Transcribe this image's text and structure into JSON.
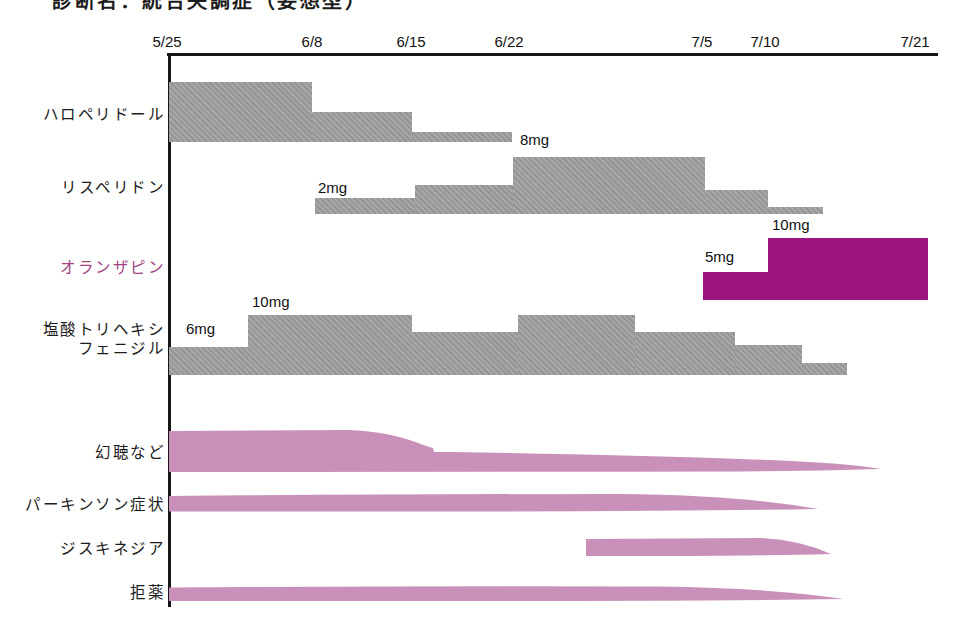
{
  "header": {
    "diagnosis_title": "診断名：統合失調症（妄想型）"
  },
  "chart_data": {
    "type": "bar",
    "subtype": "medication-timeline-gantt",
    "title": "診断名：統合失調症（妄想型）",
    "palette": {
      "bar_gray": "#9d9d9d",
      "accent_magenta": "#9c1480",
      "symptom_pink": "#c991b9",
      "title_pink": "#b2559c",
      "axis_black": "#161616"
    },
    "x_axis": {
      "unit": "date",
      "line": {
        "x1": 167,
        "x2": 938,
        "y": 53
      },
      "origin_x": 169,
      "axis_bottom_y": 607,
      "ticks": [
        {
          "label": "5/25",
          "x": 167
        },
        {
          "label": "6/8",
          "x": 312
        },
        {
          "label": "6/15",
          "x": 411
        },
        {
          "label": "6/22",
          "x": 509
        },
        {
          "label": "7/5",
          "x": 702
        },
        {
          "label": "7/10",
          "x": 765
        },
        {
          "label": "7/21",
          "x": 915
        }
      ]
    },
    "medications": [
      {
        "name": "ハロペリドール",
        "label_y": 105,
        "label_color": "#1c1c1c",
        "color": "#9d9d9d",
        "hatch": true,
        "bottom": 142,
        "segments": [
          {
            "x1": 169,
            "x2": 312,
            "top": 82,
            "from": "5/25",
            "to": "6/8"
          },
          {
            "x1": 312,
            "x2": 412,
            "top": 112,
            "from": "6/8",
            "to": "6/15"
          },
          {
            "x1": 412,
            "x2": 512,
            "top": 132,
            "from": "6/15",
            "to": "6/22"
          }
        ]
      },
      {
        "name": "リスペリドン",
        "label_y": 178,
        "label_color": "#1c1c1c",
        "color": "#9d9d9d",
        "hatch": true,
        "bottom": 214,
        "segments": [
          {
            "x1": 315,
            "x2": 415,
            "top": 198,
            "dose": "2mg",
            "from": "6/8",
            "to": "6/15"
          },
          {
            "x1": 415,
            "x2": 513,
            "top": 185,
            "from": "6/15",
            "to": "6/22"
          },
          {
            "x1": 513,
            "x2": 705,
            "top": 157,
            "dose": "8mg",
            "from": "6/22",
            "to": "7/5"
          },
          {
            "x1": 705,
            "x2": 768,
            "top": 190,
            "from": "7/5",
            "to": "7/10"
          },
          {
            "x1": 768,
            "x2": 823,
            "top": 207,
            "from": "7/10",
            "to": "7/14"
          }
        ]
      },
      {
        "name": "オランザピン",
        "label_y": 258,
        "label_color": "#a0427f",
        "color": "#9c1480",
        "hatch": false,
        "bottom": 300,
        "segments": [
          {
            "x1": 703,
            "x2": 768,
            "top": 272,
            "dose": "5mg",
            "from": "7/5",
            "to": "7/10"
          },
          {
            "x1": 768,
            "x2": 928,
            "top": 238,
            "dose": "10mg",
            "from": "7/10",
            "to": "7/21"
          }
        ]
      },
      {
        "name": "塩酸トリヘキシ\nフェニジル",
        "label_y": 320,
        "label_color": "#1c1c1c",
        "color": "#9d9d9d",
        "hatch": true,
        "bottom": 375,
        "segments": [
          {
            "x1": 169,
            "x2": 248,
            "top": 347,
            "dose": "6mg",
            "from": "5/25",
            "to": "6/2"
          },
          {
            "x1": 248,
            "x2": 412,
            "top": 315,
            "dose": "10mg",
            "from": "6/2",
            "to": "6/15"
          },
          {
            "x1": 412,
            "x2": 518,
            "top": 332,
            "from": "6/15",
            "to": "6/22"
          },
          {
            "x1": 518,
            "x2": 635,
            "top": 315,
            "from": "6/22",
            "to": "7/1"
          },
          {
            "x1": 635,
            "x2": 735,
            "top": 332,
            "from": "7/1",
            "to": "7/8"
          },
          {
            "x1": 735,
            "x2": 802,
            "top": 345,
            "from": "7/8",
            "to": "7/13"
          },
          {
            "x1": 802,
            "x2": 847,
            "top": 363,
            "from": "7/13",
            "to": "7/16"
          }
        ]
      }
    ],
    "dose_labels": [
      {
        "text": "8mg",
        "x": 520,
        "y": 131
      },
      {
        "text": "2mg",
        "x": 318,
        "y": 179
      },
      {
        "text": "10mg",
        "x": 772,
        "y": 216
      },
      {
        "text": "5mg",
        "x": 705,
        "y": 248
      },
      {
        "text": "6mg",
        "x": 186,
        "y": 320
      },
      {
        "text": "10mg",
        "x": 252,
        "y": 293
      }
    ],
    "symptoms": [
      {
        "name": "幻聴など",
        "label_y": 443,
        "from": "5/25",
        "to": "~7/19",
        "note": "strong until ~6/12 then decreases and tapers off",
        "path": "M169,431 L348,430 Q390,431 426,446 L433,448 L434,452 L450,452 Q620,455 740,459 Q840,462 881,469 Q810,471 740,471.5 Q450,472 169,472 Z"
      },
      {
        "name": "パーキンソン症状",
        "label_y": 495,
        "from": "5/25",
        "to": "~7/14",
        "path": "M169,496 Q400,494 620,494 Q740,495 818,509 Q700,511 500,511.5 L169,511.5 Z"
      },
      {
        "name": "ジスキネジア",
        "label_y": 539,
        "from": "~6/27",
        "to": "~7/15",
        "path": "M586,539 L760,538 Q800,540 831,554 Q740,556.5 586,556 Z"
      },
      {
        "name": "拒薬",
        "label_y": 583,
        "from": "5/25",
        "to": "~7/16",
        "path": "M169,587.5 Q450,585.5 660,586.5 Q770,588 844,599 Q700,601 450,601 L169,601 Z"
      }
    ]
  }
}
